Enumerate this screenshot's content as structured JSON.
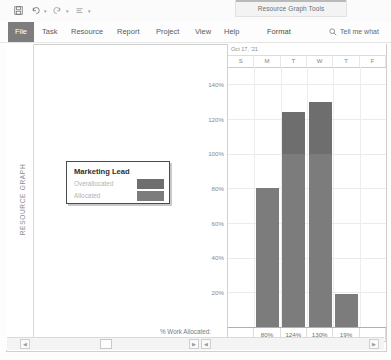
{
  "window": {
    "contextual_tab_title": "Resource Graph Tools"
  },
  "quick_access": {
    "items": [
      {
        "name": "save-icon",
        "glyph": "⬜"
      },
      {
        "name": "undo-icon",
        "glyph": "↶"
      },
      {
        "name": "redo-icon",
        "glyph": "↷"
      },
      {
        "name": "task-link-icon",
        "glyph": "≡"
      },
      {
        "name": "customize-qat-icon",
        "glyph": "≣"
      }
    ]
  },
  "ribbon": {
    "file_label": "File",
    "tabs": [
      {
        "label": "Task"
      },
      {
        "label": "Resource"
      },
      {
        "label": "Report"
      },
      {
        "label": "Project"
      },
      {
        "label": "View"
      },
      {
        "label": "Help"
      },
      {
        "label": "Format"
      }
    ],
    "tell_me": "Tell me what"
  },
  "view": {
    "pane_label": "RESOURCE GRAPH"
  },
  "legend": {
    "title": "Marketing Lead",
    "rows": [
      {
        "label": "Overallocated",
        "color": "#6e6e6e"
      },
      {
        "label": "Allocated",
        "color": "#7c7c7c"
      }
    ]
  },
  "footer": {
    "work_allocated_label": "% Work Allocated:"
  },
  "chart_data": {
    "type": "bar",
    "title": "",
    "timescale_header": "Oct 17, '21",
    "categories": [
      "S",
      "M",
      "T",
      "W",
      "T",
      "F"
    ],
    "values": [
      null,
      80,
      124,
      130,
      19,
      null
    ],
    "value_labels": [
      "",
      "80%",
      "124%",
      "130%",
      "19%",
      ""
    ],
    "xlabel": "",
    "ylabel": "% Work Allocated",
    "ylim": [
      0,
      150
    ],
    "yticks": [
      20,
      40,
      60,
      80,
      100,
      120,
      140
    ],
    "ytick_labels": [
      "20%",
      "40%",
      "60%",
      "80%",
      "100%",
      "120%",
      "140%"
    ],
    "grid": true,
    "threshold": 100,
    "colors": {
      "allocated": "#7c7c7c",
      "overallocated": "#6e6e6e"
    },
    "legend_position": "floating-left"
  }
}
